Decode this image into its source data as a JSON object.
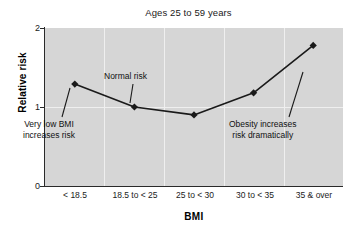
{
  "chart_data": {
    "type": "line",
    "title": "Ages 25 to 59 years",
    "xlabel": "BMI",
    "ylabel": "Relative risk",
    "categories": [
      "< 18.5",
      "18.5 to < 25",
      "25 to < 30",
      "30 to < 35",
      "35 & over"
    ],
    "values": [
      1.29,
      1.0,
      0.9,
      1.18,
      1.78
    ],
    "ylim": [
      0,
      2
    ],
    "yticks": [
      "0",
      "1",
      "2"
    ],
    "ytick_values": [
      0,
      1,
      2
    ],
    "grid": "vertical-category-separators",
    "legend": "none",
    "marker": "diamond",
    "line_color": "#1a1a1a",
    "plot_background": "#d6d6d6",
    "annotations": [
      {
        "id": "very-low",
        "line1": "Very low BMI",
        "line2": "increases risk",
        "points_to_category": "< 18.5"
      },
      {
        "id": "normal",
        "line1": "Normal risk",
        "line2": "",
        "points_to_category": "18.5 to < 25"
      },
      {
        "id": "obesity",
        "line1": "Obesity increases",
        "line2": "risk dramatically",
        "points_to_category": "35 & over"
      }
    ]
  },
  "colors": {
    "plot_bg": "#d6d6d6",
    "gridline": "#efefef",
    "axis": "#2a2a2a",
    "text": "#1a1a1a",
    "series": "#1a1a1a"
  }
}
